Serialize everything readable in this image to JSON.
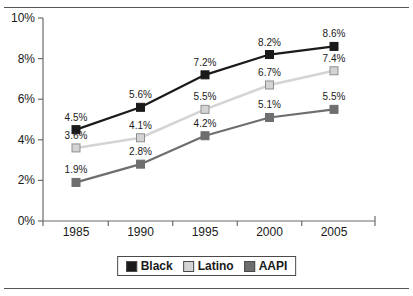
{
  "chart_data": {
    "type": "line",
    "title": "",
    "subtitle": "",
    "xlabel": "",
    "ylabel": "",
    "categories": [
      "1985",
      "1990",
      "1995",
      "2000",
      "2005"
    ],
    "series": [
      {
        "name": "Black",
        "color": "#1a1a1a",
        "values": [
          4.5,
          5.6,
          7.2,
          8.2,
          8.6
        ],
        "labels": [
          "4.5%",
          "5.6%",
          "7.2%",
          "8.2%",
          "8.6%"
        ]
      },
      {
        "name": "Latino",
        "color": "#d4d4d4",
        "values": [
          3.6,
          4.1,
          5.5,
          6.7,
          7.4
        ],
        "labels": [
          "3.6%",
          "4.1%",
          "5.5%",
          "6.7%",
          "7.4%"
        ]
      },
      {
        "name": "AAPI",
        "color": "#6e6e6e",
        "values": [
          1.9,
          2.8,
          4.2,
          5.1,
          5.5
        ],
        "labels": [
          "1.9%",
          "2.8%",
          "4.2%",
          "5.1%",
          "5.5%"
        ]
      }
    ],
    "ylim": [
      0,
      10
    ],
    "yticks": [
      0,
      2,
      4,
      6,
      8,
      10
    ],
    "ytick_labels": [
      "0%",
      "2%",
      "4%",
      "6%",
      "8%",
      "10%"
    ],
    "xtick_labels": [
      "1985",
      "1990",
      "1995",
      "2000",
      "2005"
    ],
    "grid": false,
    "legend_position": "bottom",
    "marker": "square"
  },
  "axes": {
    "y": {
      "ticks": [
        {
          "label": "10%",
          "value": 10
        },
        {
          "label": "8%",
          "value": 8
        },
        {
          "label": "6%",
          "value": 6
        },
        {
          "label": "4%",
          "value": 4
        },
        {
          "label": "2%",
          "value": 2
        },
        {
          "label": "0%",
          "value": 0
        }
      ]
    },
    "x": {
      "ticks": [
        {
          "label": "1985"
        },
        {
          "label": "1990"
        },
        {
          "label": "1995"
        },
        {
          "label": "2000"
        },
        {
          "label": "2005"
        }
      ]
    }
  },
  "legend": {
    "items": [
      {
        "label": "Black",
        "color": "#1a1a1a"
      },
      {
        "label": "Latino",
        "color": "#d4d4d4"
      },
      {
        "label": "AAPI",
        "color": "#6e6e6e"
      }
    ]
  }
}
